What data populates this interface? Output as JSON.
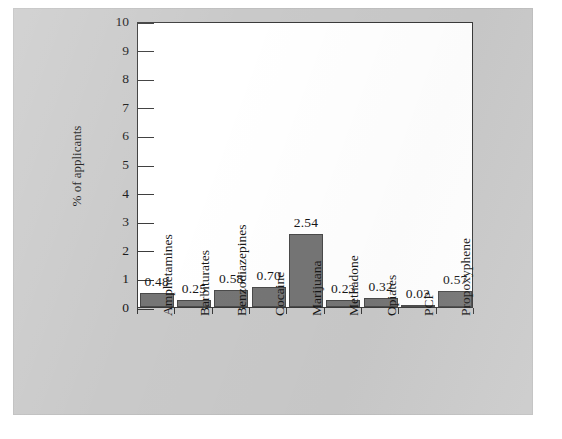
{
  "chart_data": {
    "type": "bar",
    "title": "",
    "xlabel": "",
    "ylabel": "% of applicants",
    "ylim": [
      0,
      10
    ],
    "ytick_labels": [
      "0",
      "1",
      "2",
      "3",
      "4",
      "5",
      "6",
      "7",
      "8",
      "9",
      "10"
    ],
    "grid": false,
    "legend": false,
    "bar_color": "#757575",
    "plot_background": "#ffffff",
    "page_background": "#c9c9c9",
    "categories": [
      "Amphetamines",
      "Barbiturates",
      "Benzodiazepines",
      "Cocaine",
      "Marijuana",
      "Methadone",
      "Opiates",
      "PCP",
      "Propoxyphene"
    ],
    "values": [
      0.48,
      0.25,
      0.58,
      0.7,
      2.54,
      0.23,
      0.32,
      0.02,
      0.57
    ],
    "value_labels": [
      "0.48",
      "0.25",
      "0.58",
      "0.70",
      "2.54",
      "0.23",
      "0.32",
      "0.02",
      "0.57"
    ]
  }
}
